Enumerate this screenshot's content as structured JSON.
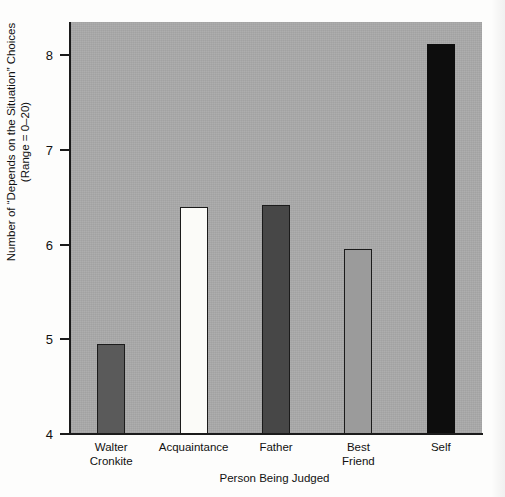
{
  "chart_data": {
    "type": "bar",
    "title": "",
    "subtitle": "",
    "xlabel": "Person Being Judged",
    "ylabel": "Number of “Depends on the Situation” Choices (Range = 0–20)",
    "ylabel_lines": [
      "Number of “Depends on the Situation” Choices",
      "(Range = 0–20)"
    ],
    "categories": [
      "Walter Cronkite",
      "Acquaintance",
      "Father",
      "Best Friend",
      "Self"
    ],
    "category_lines": [
      [
        "Walter",
        "Cronkite"
      ],
      [
        "Acquaintance"
      ],
      [
        "Father"
      ],
      [
        "Best",
        "Friend"
      ],
      [
        "Self"
      ]
    ],
    "values": [
      4.95,
      6.4,
      6.42,
      5.95,
      8.12
    ],
    "ylim": [
      4,
      8.35
    ],
    "yticks": [
      4,
      5,
      6,
      7,
      8
    ],
    "ytick_labels": [
      "4",
      "5",
      "6",
      "7",
      "8"
    ],
    "grid": false,
    "legend": false,
    "bar_styles": [
      {
        "name": "walter-cronkite",
        "fill": "#5a5a5a",
        "stroke": "#1b1b1b"
      },
      {
        "name": "acquaintance",
        "fill": "#fbfbf8",
        "stroke": "#1b1b1b"
      },
      {
        "name": "father",
        "fill": "#474747",
        "stroke": "#1b1b1b"
      },
      {
        "name": "best-friend",
        "fill": "#9b9b9b",
        "stroke": "#1b1b1b"
      },
      {
        "name": "self",
        "fill": "#0d0d0d",
        "stroke": "#0d0d0d"
      }
    ],
    "plot_background": "#a8a8a8",
    "axis_color": "#1b1b1b"
  }
}
